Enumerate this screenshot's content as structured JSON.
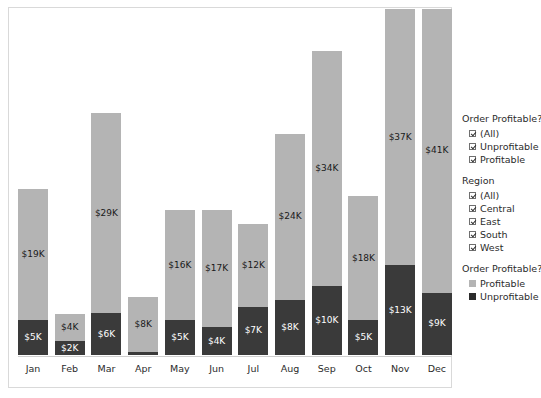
{
  "chart_data": {
    "type": "bar",
    "subtype": "stacked-bar",
    "title": "",
    "xlabel": "",
    "ylabel": "",
    "grid": false,
    "axis_visible": {
      "x": true,
      "y": false
    },
    "ylim": [
      0,
      50
    ],
    "categories": [
      "Jan",
      "Feb",
      "Mar",
      "Apr",
      "May",
      "Jun",
      "Jul",
      "Aug",
      "Sep",
      "Oct",
      "Nov",
      "Dec"
    ],
    "series": [
      {
        "name": "Unprofitable",
        "color": "#3a3a3a",
        "values": [
          5,
          2,
          6,
          0,
          5,
          4,
          7,
          8,
          10,
          5,
          13,
          9
        ],
        "labels": [
          "$5K",
          "$2K",
          "$6K",
          "",
          "$5K",
          "$4K",
          "$7K",
          "$8K",
          "$10K",
          "$5K",
          "$13K",
          "$9K"
        ]
      },
      {
        "name": "Profitable",
        "color": "#b4b4b4",
        "values": [
          19,
          4,
          29,
          8,
          16,
          17,
          12,
          24,
          34,
          18,
          37,
          41
        ],
        "labels": [
          "$19K",
          "$4K",
          "$29K",
          "$8K",
          "$16K",
          "$17K",
          "$12K",
          "$24K",
          "$34K",
          "$18K",
          "$37K",
          "$41K"
        ]
      }
    ],
    "totals": [
      24,
      6,
      35,
      8,
      21,
      21,
      19,
      32,
      44,
      23,
      50,
      50
    ],
    "legend_position": "right"
  },
  "legend": {
    "groups": [
      {
        "title": "Order Profitable?",
        "type": "checkbox",
        "items": [
          {
            "label": "(All)",
            "checked": true
          },
          {
            "label": "Unprofitable",
            "checked": true
          },
          {
            "label": "Profitable",
            "checked": true
          }
        ]
      },
      {
        "title": "Region",
        "type": "checkbox",
        "items": [
          {
            "label": "(All)",
            "checked": true
          },
          {
            "label": "Central",
            "checked": true
          },
          {
            "label": "East",
            "checked": true
          },
          {
            "label": "South",
            "checked": true
          },
          {
            "label": "West",
            "checked": true
          }
        ]
      },
      {
        "title": "Order Profitable?",
        "type": "color-key",
        "items": [
          {
            "label": "Profitable",
            "color": "#b4b4b4"
          },
          {
            "label": "Unprofitable",
            "color": "#2b2b2b"
          }
        ]
      }
    ]
  },
  "colors": {
    "profitable": "#b4b4b4",
    "unprofitable": "#3a3a3a",
    "background": "#ffffff",
    "border": "#d9d9d9",
    "text": "#2b2b2b"
  }
}
